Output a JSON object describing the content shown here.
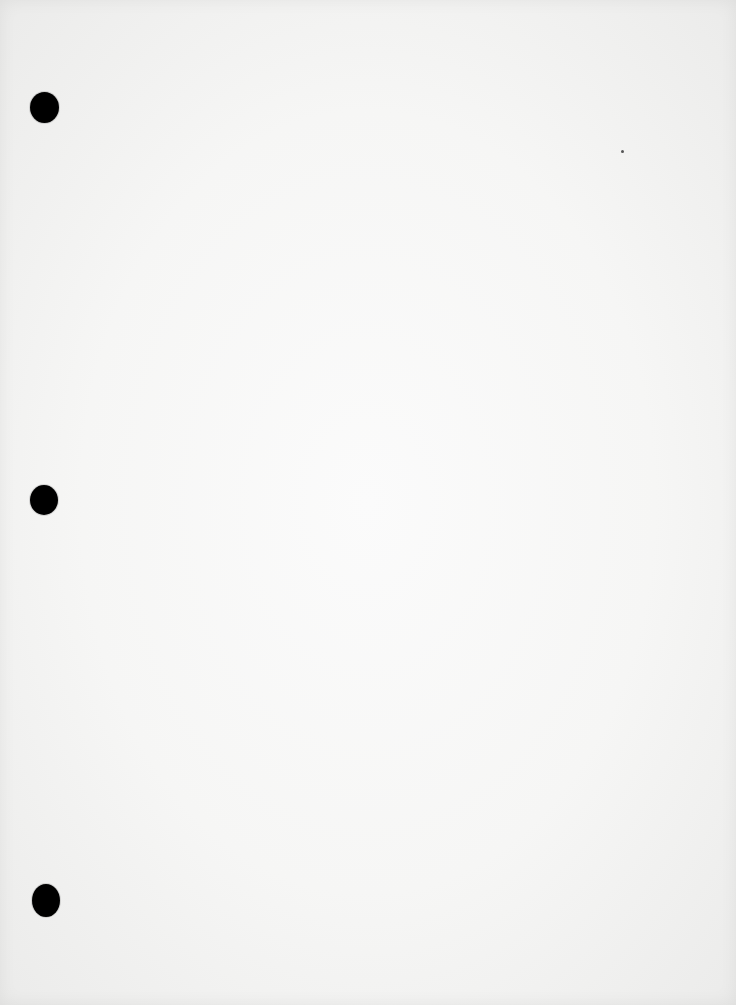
{
  "document": {
    "type": "blank scanned page",
    "text": "",
    "paper_color": "#f6f6f5",
    "punch_holes": [
      {
        "cx": 44,
        "cy": 107,
        "w": 29,
        "h": 31
      },
      {
        "cx": 44,
        "cy": 500,
        "w": 28,
        "h": 30
      },
      {
        "cx": 46,
        "cy": 901,
        "w": 28,
        "h": 33
      }
    ],
    "marks": [
      {
        "x": 622,
        "y": 151
      }
    ]
  }
}
